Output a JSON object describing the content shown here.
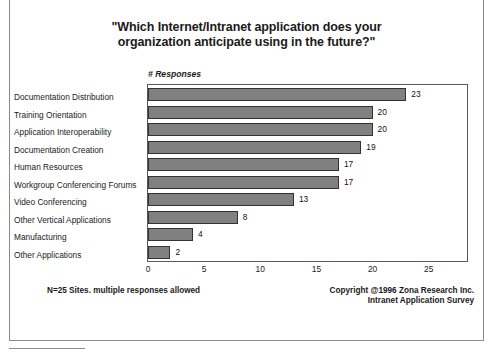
{
  "chart_data": {
    "type": "bar",
    "orientation": "horizontal",
    "title_lines": [
      "\"Which Internet/Intranet application does your",
      "organization anticipate using in the future?\""
    ],
    "title": "\"Which Internet/Intranet application does your organization anticipate using in the future?\"",
    "xlabel": "# Responses",
    "ylabel": "",
    "categories": [
      "Documentation Distribution",
      "Training Orientation",
      "Application Interoperability",
      "Documentation Creation",
      "Human Resources",
      "Workgroup Conferencing Forums",
      "Video Conferencing",
      "Other Vertical Applications",
      "Manufacturing",
      "Other Applications"
    ],
    "values": [
      23,
      20,
      20,
      19,
      17,
      17,
      13,
      8,
      4,
      2
    ],
    "value_labels": [
      "23",
      "20",
      "20",
      "19",
      "17",
      "17",
      "13",
      "8",
      "4",
      "2"
    ],
    "xticks": [
      0,
      5,
      10,
      15,
      20,
      25
    ],
    "xtick_labels": [
      "0",
      "5",
      "10",
      "15",
      "20",
      "25"
    ],
    "xlim": [
      0,
      28.5
    ],
    "grid": false,
    "legend": "none",
    "bar_color": "#808080",
    "bar_edge_color": "#333333",
    "plot_border_color": "#5a5a5a",
    "background": "#ffffff"
  },
  "footer": {
    "left_note": "N=25 Sites. multiple responses allowed",
    "copyright_lines": [
      "Copyright @1996 Zona Research Inc.",
      "Intranet Application Survey"
    ]
  }
}
